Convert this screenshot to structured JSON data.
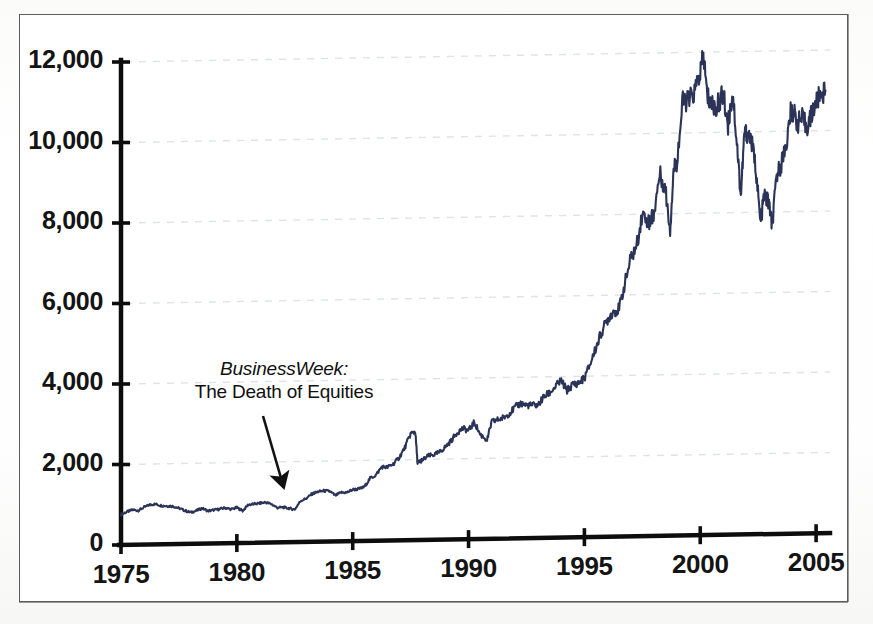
{
  "figure": {
    "background_color": "#ffffff",
    "frame_color": "#5c5c5c",
    "series_color": "#2b3457",
    "gridline_color": "#dfe3e6",
    "axis_color": "#0d0d0d"
  },
  "annotation": {
    "name": "business-week-death-of-equities",
    "line1": "BusinessWeek:",
    "line2": "The Death of Equities",
    "points_to_year": 1982
  },
  "chart_data": {
    "type": "line",
    "title": "",
    "subtitle": "",
    "xlabel": "",
    "ylabel": "",
    "xlim": [
      1975,
      2005.6
    ],
    "ylim": [
      0,
      12000
    ],
    "grid": true,
    "grid_axis": "y",
    "legend": "none",
    "series_name": "Dow Jones Industrial Average",
    "xticks": [
      1975,
      1980,
      1985,
      1990,
      1995,
      2000,
      2005
    ],
    "xticklabels": [
      "1975",
      "1980",
      "1985",
      "1990",
      "1995",
      "2000",
      "2005"
    ],
    "yticks": [
      0,
      2000,
      4000,
      6000,
      8000,
      10000,
      12000
    ],
    "yticklabels": [
      "0",
      "2,000",
      "4,000",
      "6,000",
      "8,000",
      "10,000",
      "12,000"
    ],
    "annotations": [
      {
        "text": "BusinessWeek: The Death of Equities",
        "x": 1982.0,
        "y": 1050
      }
    ],
    "x": [
      1975.0,
      1975.25,
      1975.5,
      1975.75,
      1976.0,
      1976.25,
      1976.5,
      1976.75,
      1977.0,
      1977.25,
      1977.5,
      1977.75,
      1978.0,
      1978.25,
      1978.5,
      1978.75,
      1979.0,
      1979.25,
      1979.5,
      1979.75,
      1980.0,
      1980.25,
      1980.5,
      1980.75,
      1981.0,
      1981.25,
      1981.5,
      1981.75,
      1982.0,
      1982.25,
      1982.5,
      1982.75,
      1983.0,
      1983.25,
      1983.5,
      1983.75,
      1984.0,
      1984.25,
      1984.5,
      1984.75,
      1985.0,
      1985.25,
      1985.5,
      1985.75,
      1986.0,
      1986.25,
      1986.5,
      1986.75,
      1987.0,
      1987.25,
      1987.5,
      1987.7,
      1987.8,
      1987.9,
      1988.0,
      1988.25,
      1988.5,
      1988.75,
      1989.0,
      1989.25,
      1989.5,
      1989.75,
      1990.0,
      1990.25,
      1990.5,
      1990.8,
      1991.0,
      1991.25,
      1991.5,
      1991.75,
      1992.0,
      1992.25,
      1992.5,
      1992.75,
      1993.0,
      1993.25,
      1993.5,
      1993.75,
      1994.0,
      1994.25,
      1994.5,
      1994.75,
      1995.0,
      1995.25,
      1995.5,
      1995.75,
      1996.0,
      1996.25,
      1996.5,
      1996.75,
      1997.0,
      1997.25,
      1997.5,
      1997.8,
      1997.9,
      1998.0,
      1998.25,
      1998.5,
      1998.7,
      1998.85,
      1999.0,
      1999.25,
      1999.5,
      1999.75,
      2000.0,
      2000.15,
      2000.3,
      2000.5,
      2000.7,
      2000.9,
      2001.0,
      2001.2,
      2001.4,
      2001.6,
      2001.75,
      2001.9,
      2002.0,
      2002.2,
      2002.4,
      2002.6,
      2002.75,
      2002.9,
      2003.0,
      2003.1,
      2003.3,
      2003.5,
      2003.75,
      2003.9,
      2004.0,
      2004.2,
      2004.4,
      2004.6,
      2004.8,
      2005.0,
      2005.2,
      2005.4
    ],
    "y": [
      760,
      820,
      870,
      850,
      930,
      990,
      1000,
      960,
      950,
      940,
      890,
      830,
      780,
      820,
      880,
      810,
      830,
      850,
      880,
      840,
      880,
      800,
      950,
      960,
      980,
      1000,
      950,
      860,
      870,
      840,
      810,
      1020,
      1080,
      1190,
      1240,
      1260,
      1250,
      1140,
      1210,
      1210,
      1280,
      1290,
      1340,
      1550,
      1630,
      1830,
      1820,
      1900,
      2050,
      2300,
      2640,
      2700,
      1900,
      1950,
      1980,
      2080,
      2110,
      2170,
      2300,
      2450,
      2650,
      2750,
      2700,
      2900,
      2600,
      2450,
      2900,
      2950,
      3000,
      3100,
      3250,
      3350,
      3300,
      3300,
      3300,
      3500,
      3600,
      3750,
      3900,
      3650,
      3800,
      3830,
      3950,
      4300,
      4700,
      5100,
      5400,
      5600,
      5650,
      6300,
      6900,
      7200,
      8000,
      7800,
      7900,
      8000,
      9000,
      8600,
      7600,
      9100,
      9300,
      10800,
      10800,
      11000,
      11500,
      11900,
      10900,
      10700,
      10600,
      10900,
      10900,
      10200,
      11000,
      9600,
      8400,
      9900,
      10000,
      9800,
      9100,
      7700,
      8400,
      8300,
      8100,
      7600,
      8900,
      9200,
      9800,
      10450,
      10500,
      10200,
      10300,
      10100,
      10400,
      10700,
      10900,
      11000
    ]
  }
}
